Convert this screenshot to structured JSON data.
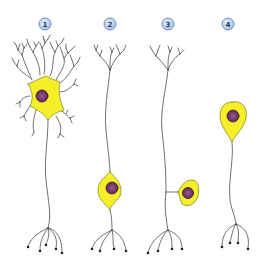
{
  "diagram": {
    "title": "",
    "neurons": [
      {
        "label": "1",
        "type": "multipolar",
        "badge_x": 45,
        "badge_y": 24
      },
      {
        "label": "2",
        "type": "bipolar",
        "badge_x": 110,
        "badge_y": 24
      },
      {
        "label": "3",
        "type": "pseudounipolar",
        "badge_x": 168,
        "badge_y": 24
      },
      {
        "label": "4",
        "type": "unipolar",
        "badge_x": 228,
        "badge_y": 24
      }
    ],
    "colors": {
      "soma_fill": "#f5ef2a",
      "soma_stroke": "#8a8a2a",
      "nucleus_fill": "#7a3f6e",
      "nucleus_stroke": "#3c1c36",
      "process_stroke": "#333333",
      "badge_fill": "#b8cde8",
      "badge_stroke": "#6f8fbf",
      "badge_text": "#1f3566"
    }
  }
}
